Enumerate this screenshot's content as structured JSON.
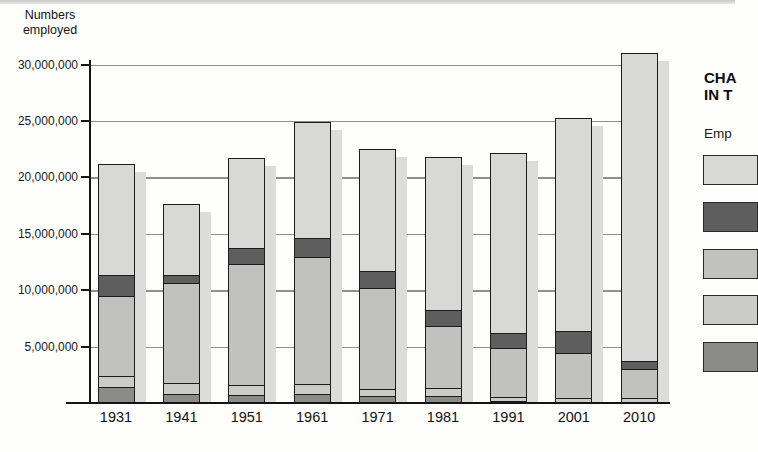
{
  "page": {
    "bg": "#fefefd",
    "top_edge_color": "#c9c9c9"
  },
  "y_axis": {
    "title_line1": "Numbers",
    "title_line2": "employed",
    "ticks": [
      {
        "label": "30,000,000",
        "value_millions": 30
      },
      {
        "label": "25,000,000",
        "value_millions": 25
      },
      {
        "label": "20,000,000",
        "value_millions": 20
      },
      {
        "label": "15,000,000",
        "value_millions": 15
      },
      {
        "label": "10,000,000",
        "value_millions": 10
      },
      {
        "label": "5,000,000",
        "value_millions": 5
      }
    ]
  },
  "x_axis": {
    "labels": [
      "1931",
      "1941",
      "1951",
      "1961",
      "1971",
      "1981",
      "1991",
      "2001",
      "2010"
    ]
  },
  "legend_panel": {
    "title_line1": "CHA",
    "title_line2": "IN T",
    "note": "Emp",
    "cropped": "legend text is cut off at the right edge of the image",
    "swatches": [
      {
        "name": "top-band-light-gray",
        "color": "#d8d8d6"
      },
      {
        "name": "second-band-dark-gray",
        "color": "#5e5e5e"
      },
      {
        "name": "middle-band-medium-hatched",
        "color": "#c1c1bf"
      },
      {
        "name": "fourth-band-pale-gray",
        "color": "#cbcbc9"
      },
      {
        "name": "bottom-band-mid-gray",
        "color": "#8b8b89"
      }
    ]
  },
  "chart_data": {
    "type": "bar",
    "stacked": true,
    "title": "",
    "ylabel": "Numbers employed",
    "xlabel": "",
    "categories": [
      "1931",
      "1941",
      "1951",
      "1961",
      "1971",
      "1981",
      "1991",
      "2001",
      "2010"
    ],
    "ylim": [
      0,
      31500000
    ],
    "ytick_step": 5000000,
    "grid": true,
    "legend_position": "right (labels cropped out of frame)",
    "bar_style": "each bar has a light gray drop shadow offset right and down",
    "series_order": "bottom to top of stack",
    "series": [
      {
        "name": "bottom-band-mid-gray",
        "color": "#8b8b89",
        "texture": "flat",
        "values_millions": [
          1.5,
          0.9,
          0.8,
          0.9,
          0.7,
          0.7,
          0.3,
          0.2,
          0.2
        ]
      },
      {
        "name": "fourth-band-pale-gray",
        "color": "#cbcbc9",
        "texture": "flat",
        "values_millions": [
          1.0,
          1.0,
          0.9,
          0.9,
          0.6,
          0.7,
          0.3,
          0.3,
          0.3
        ]
      },
      {
        "name": "middle-band-medium-hatched",
        "color": "#c1c1bf",
        "texture": "hatch",
        "values_millions": [
          7.1,
          8.8,
          10.7,
          11.2,
          9.0,
          5.5,
          4.4,
          4.0,
          2.6
        ]
      },
      {
        "name": "second-band-dark-gray",
        "color": "#5e5e5e",
        "texture": "flat",
        "values_millions": [
          1.8,
          0.7,
          1.4,
          1.7,
          1.5,
          1.4,
          1.3,
          2.0,
          0.7
        ]
      },
      {
        "name": "top-band-light-gray",
        "color": "#d8d8d6",
        "texture": "fine",
        "values_millions": [
          9.8,
          6.2,
          7.9,
          10.2,
          10.7,
          13.5,
          15.9,
          18.8,
          27.2
        ]
      }
    ],
    "totals_millions": [
      21.2,
      17.6,
      21.7,
      24.9,
      22.5,
      21.8,
      22.2,
      25.3,
      31.0
    ]
  }
}
